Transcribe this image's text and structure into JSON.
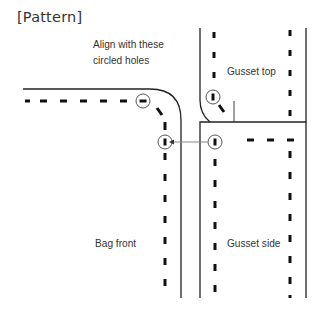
{
  "title": "[Pattern]",
  "labels": {
    "instruction_line1": "Align with these",
    "instruction_line2": "circled holes",
    "gusset_top": "Gusset top",
    "bag_front": "Bag front",
    "gusset_side": "Gusset side"
  },
  "pieces": [
    {
      "name": "Bag front",
      "role": "front panel"
    },
    {
      "name": "Gusset top",
      "role": "top gusset strip"
    },
    {
      "name": "Gusset side",
      "role": "side gusset strip"
    }
  ],
  "markers": {
    "circled_holes": [
      {
        "piece": "Bag front",
        "position": "top corner"
      },
      {
        "piece": "Bag front",
        "position": "side corner"
      },
      {
        "piece": "Gusset top",
        "position": "bottom end"
      },
      {
        "piece": "Gusset side",
        "position": "top end"
      }
    ],
    "arrow": {
      "from": "Gusset side hole",
      "to": "Bag front side hole"
    }
  },
  "colors": {
    "line": "#222222",
    "arrow": "#888888",
    "circle": "#555555"
  }
}
